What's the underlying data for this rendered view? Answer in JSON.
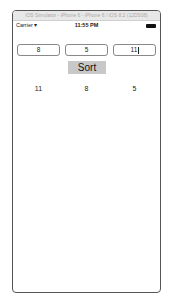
{
  "window": {
    "title": "iOS Simulator - iPhone 6 - iPhone 6 / iOS 8.2 (12D508)"
  },
  "statusbar": {
    "carrier": "Carrier ▾",
    "time": "11:55 PM",
    "battery_icon": "battery-full-icon"
  },
  "inputs": [
    {
      "value": "8"
    },
    {
      "value": "5"
    },
    {
      "value": "11",
      "focused": true
    }
  ],
  "sort_button": {
    "label": "Sort",
    "color": "#c8c8c8"
  },
  "results": [
    "11",
    "8",
    "5"
  ]
}
